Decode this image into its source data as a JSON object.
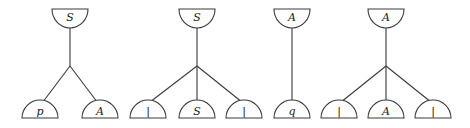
{
  "diagram": {
    "type": "derivation-trees",
    "colors": {
      "stroke": "#3a3a3a",
      "text": "#222222",
      "background": "#ffffff"
    },
    "trees": [
      {
        "id": "tree-1",
        "root": "S",
        "children": [
          "p",
          "A"
        ]
      },
      {
        "id": "tree-2",
        "root": "S",
        "children": [
          "|",
          "S",
          "|"
        ]
      },
      {
        "id": "tree-3",
        "root": "A",
        "children": [
          "q"
        ]
      },
      {
        "id": "tree-4",
        "root": "A",
        "children": [
          "|",
          "A",
          "|"
        ]
      }
    ]
  }
}
